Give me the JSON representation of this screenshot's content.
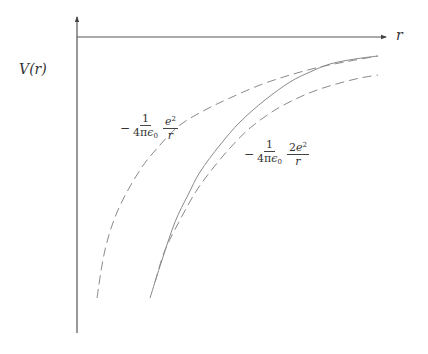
{
  "chart_data": {
    "type": "line",
    "title": "",
    "xlabel": "r",
    "ylabel": "V(r)",
    "grid": false,
    "legend": "none (inline annotations)",
    "axes": {
      "origin_px": [
        77,
        37
      ],
      "x_axis_end_px": [
        386,
        37
      ],
      "y_axis_top_px": [
        77,
        17
      ],
      "y_axis_bottom_px": [
        77,
        333
      ],
      "arrows": [
        "x-right",
        "y-up"
      ]
    },
    "series": [
      {
        "name": "-1/(4πε0) e^2/r",
        "style": "dashed",
        "points_px": [
          [
            97,
            298
          ],
          [
            105,
            250
          ],
          [
            118,
            210
          ],
          [
            140,
            170
          ],
          [
            160,
            145
          ],
          [
            180,
            125
          ],
          [
            205,
            110
          ],
          [
            230,
            98
          ],
          [
            260,
            85
          ],
          [
            290,
            75
          ],
          [
            320,
            67
          ],
          [
            350,
            61
          ],
          [
            378,
            56
          ]
        ]
      },
      {
        "name": "V(r) (actual potential)",
        "style": "solid",
        "points_px": [
          [
            150,
            298
          ],
          [
            162,
            260
          ],
          [
            175,
            222
          ],
          [
            188,
            195
          ],
          [
            200,
            172
          ],
          [
            220,
            145
          ],
          [
            240,
            122
          ],
          [
            265,
            100
          ],
          [
            290,
            82
          ],
          [
            310,
            72
          ],
          [
            330,
            64
          ],
          [
            355,
            59
          ],
          [
            378,
            56
          ]
        ]
      },
      {
        "name": "-1/(4πε0) 2e^2/r",
        "style": "dashed",
        "points_px": [
          [
            155,
            282
          ],
          [
            165,
            250
          ],
          [
            180,
            220
          ],
          [
            195,
            193
          ],
          [
            210,
            172
          ],
          [
            230,
            148
          ],
          [
            250,
            128
          ],
          [
            275,
            110
          ],
          [
            300,
            97
          ],
          [
            320,
            89
          ],
          [
            340,
            83
          ],
          [
            360,
            78
          ],
          [
            378,
            75
          ]
        ]
      }
    ],
    "annotations": [
      {
        "text": "-1/(4πε0) · e^2/r",
        "position_px": [
          118,
          128
        ],
        "refers_to": "upper dashed curve"
      },
      {
        "text": "-1/(4πε0) · 2e^2/r",
        "position_px": [
          243,
          155
        ],
        "refers_to": "lower dashed curve"
      }
    ]
  },
  "labels": {
    "y_axis": {
      "main": "V",
      "arg": "(r)"
    },
    "x_axis": "r",
    "annot1": {
      "minus": "−",
      "num1": "1",
      "den1_a": "4π",
      "den1_b": "ϵ",
      "den1_sub": "0",
      "num2_base": "e",
      "num2_sup": "2",
      "den2": "r"
    },
    "annot2": {
      "minus": "−",
      "num1": "1",
      "den1_a": "4π",
      "den1_b": "ϵ",
      "den1_sub": "0",
      "num2_pre": "2",
      "num2_base": "e",
      "num2_sup": "2",
      "den2": "r"
    }
  },
  "colors": {
    "axis": "#555555",
    "curve": "#8a8a8a",
    "text": "#333333"
  }
}
